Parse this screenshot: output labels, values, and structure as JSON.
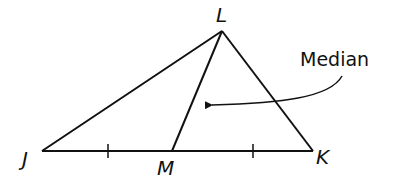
{
  "diagram": {
    "type": "triangle-median",
    "vertices": {
      "J": {
        "label": "J",
        "x": 42,
        "y": 151
      },
      "K": {
        "label": "K",
        "x": 313,
        "y": 151
      },
      "L": {
        "label": "L",
        "x": 222,
        "y": 31
      },
      "M": {
        "label": "M",
        "x": 172,
        "y": 151
      }
    },
    "segments": [
      "JK",
      "JL",
      "KL",
      "LM"
    ],
    "tick_marks": [
      "JM",
      "MK"
    ],
    "annotation": {
      "text": "Median",
      "points_to": "LM"
    },
    "stroke_color": "#111111",
    "background": "#ffffff"
  }
}
